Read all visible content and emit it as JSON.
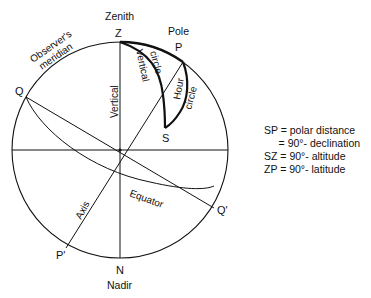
{
  "diagram": {
    "points": {
      "zenith_label": "Zenith",
      "z": "Z",
      "pole_label": "Pole",
      "p": "P",
      "q": "Q",
      "q_prime": "Q'",
      "s": "S",
      "p_prime": "P'",
      "n": "N",
      "nadir_label": "Nadir"
    },
    "curve_labels": {
      "observers_meridian_1": "Observer's",
      "observers_meridian_2": "meridian",
      "vertical": "Vertical",
      "vertical_circle_1": "Vertical",
      "vertical_circle_2": "circle",
      "hour_circle_1": "Hour",
      "hour_circle_2": "circle",
      "axis": "Axis",
      "equator": "Equator"
    },
    "legend": [
      "SP = polar distance",
      "     = 90°- declination",
      "SZ = 90°- altitude",
      "ZP = 90°- latitude"
    ]
  }
}
